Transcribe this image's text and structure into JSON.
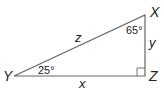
{
  "diagram": {
    "type": "right-triangle",
    "vertices": {
      "X": "X",
      "Y": "Y",
      "Z": "Z"
    },
    "sides": {
      "hypotenuse": "z",
      "vertical": "y",
      "horizontal": "x"
    },
    "angles": {
      "at_X": "65°",
      "at_Y": "25°",
      "at_Z": "right-angle"
    },
    "line_color": "#555555",
    "text_color": "#222222"
  }
}
